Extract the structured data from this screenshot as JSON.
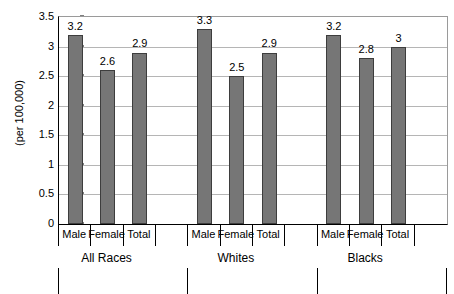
{
  "chart_data": {
    "type": "bar",
    "title": "",
    "xlabel": "",
    "ylabel": "(per 100,000)",
    "ylim": [
      0,
      3.5
    ],
    "yticks": [
      "0",
      "0.5",
      "1",
      "1.5",
      "2",
      "2.5",
      "3",
      "3.5"
    ],
    "ytick_values": [
      0,
      0.5,
      1,
      1.5,
      2,
      2.5,
      3,
      3.5
    ],
    "grid": "horizontal",
    "legend": "none",
    "categories": [
      "Male",
      "Female",
      "Total"
    ],
    "groups": [
      "All Races",
      "Whites",
      "Blacks"
    ],
    "series": [
      {
        "name": "All Races",
        "values": [
          3.2,
          2.6,
          2.9
        ],
        "labels": [
          "3.2",
          "2.6",
          "2.9"
        ]
      },
      {
        "name": "Whites",
        "values": [
          3.3,
          2.5,
          2.9
        ],
        "labels": [
          "3.3",
          "2.5",
          "2.9"
        ]
      },
      {
        "name": "Blacks",
        "values": [
          3.2,
          2.8,
          3.0
        ],
        "labels": [
          "3.2",
          "2.8",
          "3"
        ]
      }
    ],
    "bar_color": "#767676",
    "bar_border_color": "#3d3d3d",
    "gridline_color": "#b5b5b5",
    "axis_color": "#000000"
  }
}
